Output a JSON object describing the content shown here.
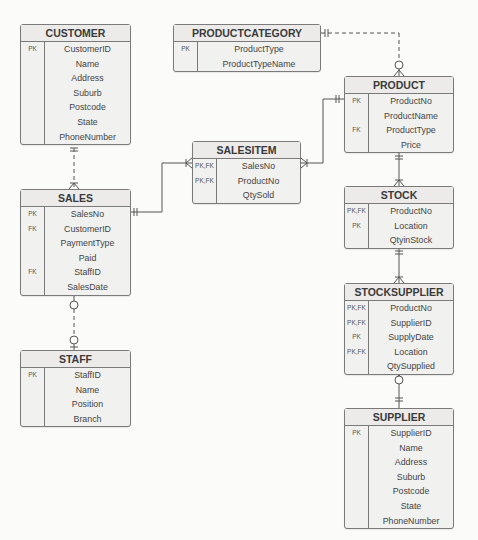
{
  "diagram": {
    "type": "entity-relationship",
    "notation": "crow's foot"
  },
  "entities": {
    "customer": {
      "name": "CUSTOMER",
      "keys": [
        "PK",
        "",
        "",
        "",
        "",
        "",
        ""
      ],
      "attributes": [
        "CustomerID",
        "Name",
        "Address",
        "Suburb",
        "Postcode",
        "State",
        "PhoneNumber"
      ]
    },
    "productcategory": {
      "name": "PRODUCTCATEGORY",
      "keys": [
        "PK",
        ""
      ],
      "attributes": [
        "ProductType",
        "ProductTypeName"
      ]
    },
    "product": {
      "name": "PRODUCT",
      "keys": [
        "PK",
        "",
        "FK",
        ""
      ],
      "attributes": [
        "ProductNo",
        "ProductName",
        "ProductType",
        "Price"
      ]
    },
    "salesitem": {
      "name": "SALESITEM",
      "keys": [
        "PK,FK",
        "PK,FK",
        ""
      ],
      "attributes": [
        "SalesNo",
        "ProductNo",
        "QtySold"
      ]
    },
    "sales": {
      "name": "SALES",
      "keys": [
        "PK",
        "FK",
        "",
        "",
        "FK",
        ""
      ],
      "attributes": [
        "SalesNo",
        "CustomerID",
        "PaymentType",
        "Paid",
        "StaffID",
        "SalesDate"
      ]
    },
    "staff": {
      "name": "STAFF",
      "keys": [
        "PK",
        "",
        "",
        ""
      ],
      "attributes": [
        "StaffID",
        "Name",
        "Position",
        "Branch"
      ]
    },
    "stock": {
      "name": "STOCK",
      "keys": [
        "PK,FK",
        "PK",
        ""
      ],
      "attributes": [
        "ProductNo",
        "Location",
        "QtyinStock"
      ]
    },
    "stocksupplier": {
      "name": "STOCKSUPPLIER",
      "keys": [
        "PK,FK",
        "PK,FK",
        "PK",
        "PK,FK",
        ""
      ],
      "attributes": [
        "ProductNo",
        "SupplierID",
        "SupplyDate",
        "Location",
        "QtySupplied"
      ]
    },
    "supplier": {
      "name": "SUPPLIER",
      "keys": [
        "PK",
        "",
        "",
        "",
        "",
        "",
        ""
      ],
      "attributes": [
        "SupplierID",
        "Name",
        "Address",
        "Suburb",
        "Postcode",
        "State",
        "PhoneNumber"
      ]
    }
  },
  "relationships": [
    {
      "from": "CUSTOMER",
      "to": "SALES",
      "from_card": "one-and-only-one",
      "to_card": "one-or-many",
      "line": "dashed"
    },
    {
      "from": "PRODUCTCATEGORY",
      "to": "PRODUCT",
      "from_card": "one-and-only-one",
      "to_card": "zero-or-many",
      "line": "dashed"
    },
    {
      "from": "SALES",
      "to": "SALESITEM",
      "from_card": "one-and-only-one",
      "to_card": "one-or-many",
      "line": "solid"
    },
    {
      "from": "PRODUCT",
      "to": "SALESITEM",
      "from_card": "one-and-only-one",
      "to_card": "one-or-many",
      "line": "solid"
    },
    {
      "from": "STAFF",
      "to": "SALES",
      "from_card": "zero-or-one",
      "to_card": "zero-or-many",
      "line": "dashed"
    },
    {
      "from": "PRODUCT",
      "to": "STOCK",
      "from_card": "one-and-only-one",
      "to_card": "one-or-many",
      "line": "solid"
    },
    {
      "from": "STOCK",
      "to": "STOCKSUPPLIER",
      "from_card": "one-and-only-one",
      "to_card": "one-or-many",
      "line": "solid"
    },
    {
      "from": "SUPPLIER",
      "to": "STOCKSUPPLIER",
      "from_card": "one-and-only-one",
      "to_card": "zero-or-many",
      "line": "solid"
    }
  ]
}
